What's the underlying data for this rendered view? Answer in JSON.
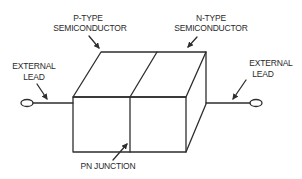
{
  "diagram": {
    "type": "pn-junction-block",
    "labels": {
      "p_type_line1": "P-TYPE",
      "p_type_line2": "SEMICONDUCTOR",
      "n_type_line1": "N-TYPE",
      "n_type_line2": "SEMICONDUCTOR",
      "left_lead_line1": "EXTERNAL",
      "left_lead_line2": "LEAD",
      "right_lead_line1": "EXTERNAL",
      "right_lead_line2": "LEAD",
      "junction": "PN JUNCTION"
    },
    "colors": {
      "line": "#2e2e2e",
      "text": "#2a2a2a",
      "background": "#ffffff"
    }
  }
}
